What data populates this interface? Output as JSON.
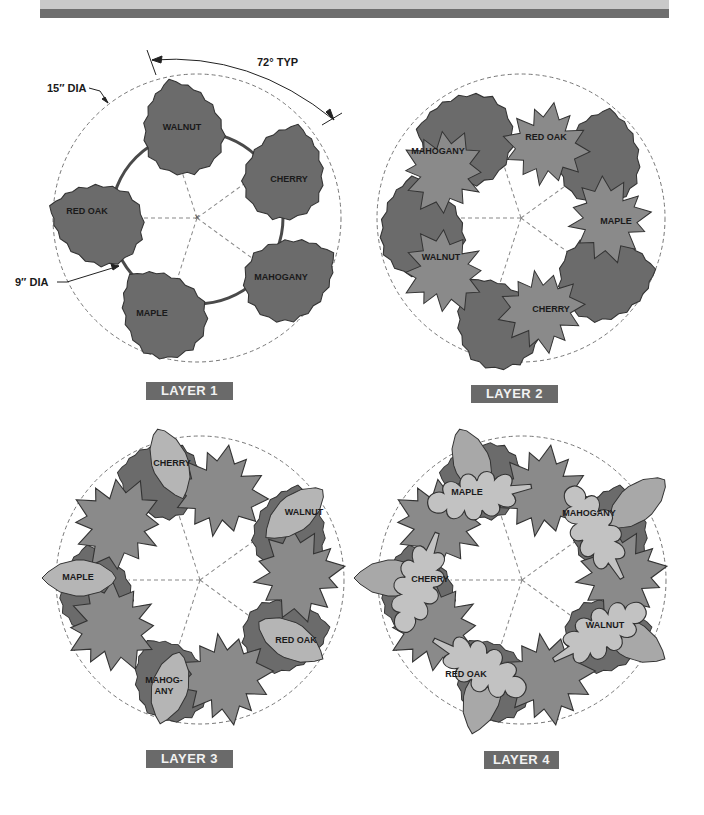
{
  "header": {
    "band_light_color": "#c9c9c9",
    "band_dark_color": "#6e6e6e"
  },
  "dimensions": {
    "outer_diameter": "15″ DIA",
    "inner_diameter": "9″ DIA",
    "angle": "72° TYP"
  },
  "colors": {
    "birch_leaf": "#6b6b6b",
    "maple_leaf": "#8a8a8a",
    "elm_leaf": "#b5b5b5",
    "oak_leaf": "#c2c2c2",
    "tag_bg": "#6a6a6a"
  },
  "layers": [
    {
      "tag": "LAYER 1",
      "leaves": [
        {
          "name": "WALNUT"
        },
        {
          "name": "CHERRY"
        },
        {
          "name": "MAHOGANY"
        },
        {
          "name": "MAPLE"
        },
        {
          "name": "RED OAK"
        }
      ]
    },
    {
      "tag": "LAYER 2",
      "leaves": [
        {
          "name": "RED OAK"
        },
        {
          "name": "MAPLE"
        },
        {
          "name": "CHERRY"
        },
        {
          "name": "WALNUT"
        },
        {
          "name": "MAHOGANY"
        }
      ]
    },
    {
      "tag": "LAYER 3",
      "leaves": [
        {
          "name": "CHERRY"
        },
        {
          "name": "WALNUT"
        },
        {
          "name": "RED OAK"
        },
        {
          "name": "MAHOG-"
        },
        {
          "name": "ANY"
        },
        {
          "name": "MAPLE"
        }
      ]
    },
    {
      "tag": "LAYER 4",
      "leaves": [
        {
          "name": "MAPLE"
        },
        {
          "name": "MAHOGANY"
        },
        {
          "name": "WALNUT"
        },
        {
          "name": "RED OAK"
        },
        {
          "name": "CHERRY"
        }
      ]
    }
  ]
}
